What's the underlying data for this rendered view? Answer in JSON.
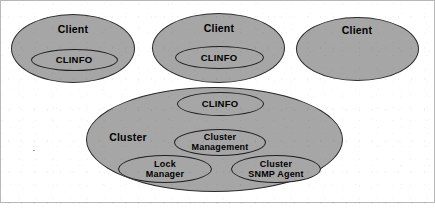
{
  "diagram": {
    "style": {
      "node_fill": "#a6a6a6",
      "node_stroke": "#2b2b2b",
      "text_color": "#000000",
      "background": "#ffffff",
      "frame_color": "#b8b8b8"
    },
    "clients": [
      {
        "id": "client-1",
        "label": "Client",
        "x": 11,
        "y": 14,
        "w": 124,
        "h": 69,
        "label_cx": 73,
        "label_cy": 30,
        "inner": {
          "id": "client-1-clinfo",
          "label": "CLINFO",
          "x": 31,
          "y": 49,
          "w": 87,
          "h": 22,
          "label_cx": 74,
          "label_cy": 60
        }
      },
      {
        "id": "client-2",
        "label": "Client",
        "x": 152,
        "y": 13,
        "w": 133,
        "h": 70,
        "label_cx": 219,
        "label_cy": 29,
        "inner": {
          "id": "client-2-clinfo",
          "label": "CLINFO",
          "x": 175,
          "y": 46,
          "w": 89,
          "h": 23,
          "label_cx": 219,
          "label_cy": 58
        }
      },
      {
        "id": "client-3",
        "label": "Client",
        "x": 296,
        "y": 17,
        "w": 123,
        "h": 64,
        "label_cx": 357,
        "label_cy": 31,
        "inner": null
      }
    ],
    "cluster": {
      "id": "cluster",
      "label": "Cluster",
      "x": 86,
      "y": 87,
      "w": 257,
      "h": 105,
      "label_cx": 128,
      "label_cy": 138,
      "components": [
        {
          "id": "cluster-clinfo",
          "label": "CLINFO",
          "x": 177,
          "y": 92,
          "w": 87,
          "h": 24,
          "label_cx": 220,
          "label_cy": 104
        },
        {
          "id": "cluster-management",
          "label": "Cluster\nManagement",
          "x": 174,
          "y": 129,
          "w": 92,
          "h": 27,
          "label_cx": 220,
          "label_cy": 142
        },
        {
          "id": "lock-manager",
          "label": "Lock\nManager",
          "x": 118,
          "y": 155,
          "w": 94,
          "h": 28,
          "label_cx": 165,
          "label_cy": 169
        },
        {
          "id": "cluster-snmp-agent",
          "label": "Cluster\nSNMP Agent",
          "x": 231,
          "y": 155,
          "w": 90,
          "h": 28,
          "label_cx": 276,
          "label_cy": 169
        }
      ]
    }
  }
}
